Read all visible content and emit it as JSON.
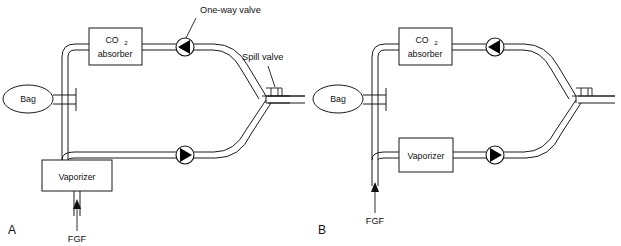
{
  "figure": {
    "background_color": "#ffffff",
    "line_color": "#1a1a1a",
    "valve_fill_color": "#000000"
  },
  "panels": [
    {
      "id": "A",
      "letter": "A",
      "vaporizer_position": "vertical-below-bag-limb",
      "labels": {
        "one_way_valve": "One-way valve",
        "spill_valve": "Spill valve",
        "fgf": "FGF"
      },
      "components": [
        {
          "name": "bag",
          "label": "Bag",
          "shape": "ellipse"
        },
        {
          "name": "co2-absorber",
          "label_line1": "CO",
          "label_sub": "2",
          "label_line2": "absorber",
          "shape": "rect"
        },
        {
          "name": "vaporizer",
          "label": "Vaporizer",
          "shape": "rect"
        },
        {
          "name": "inspiratory-one-way-valve",
          "direction": "left",
          "shape": "circle-triangle"
        },
        {
          "name": "expiratory-one-way-valve",
          "direction": "right",
          "shape": "circle-triangle"
        },
        {
          "name": "spill-valve",
          "shape": "t-valve"
        },
        {
          "name": "fgf-inlet",
          "label": "FGF",
          "shape": "arrow-up"
        }
      ]
    },
    {
      "id": "B",
      "letter": "B",
      "vaporizer_position": "inline-lower-limb",
      "labels": {
        "fgf": "FGF"
      },
      "components": [
        {
          "name": "bag",
          "label": "Bag",
          "shape": "ellipse"
        },
        {
          "name": "co2-absorber",
          "label_line1": "CO",
          "label_sub": "2",
          "label_line2": "absorber",
          "shape": "rect"
        },
        {
          "name": "vaporizer",
          "label": "Vaporizer",
          "shape": "rect"
        },
        {
          "name": "inspiratory-one-way-valve",
          "direction": "left",
          "shape": "circle-triangle"
        },
        {
          "name": "expiratory-one-way-valve",
          "direction": "right",
          "shape": "circle-triangle"
        },
        {
          "name": "spill-valve",
          "shape": "t-valve"
        },
        {
          "name": "fgf-inlet",
          "label": "FGF",
          "shape": "arrow-up"
        }
      ]
    }
  ]
}
